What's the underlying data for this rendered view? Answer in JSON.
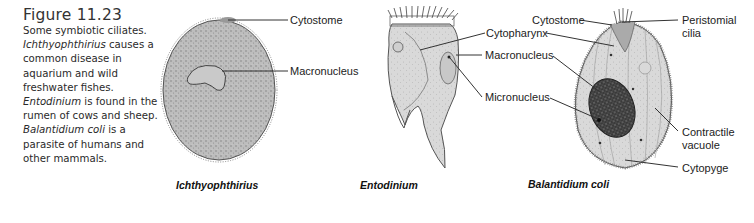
{
  "figure": {
    "number": "Figure 11.23",
    "caption_parts": [
      {
        "text": "Some symbiotic ciliates. ",
        "italic": false
      },
      {
        "text": "Ichthyophthirius",
        "italic": true
      },
      {
        "text": " causes a common disease in aquarium and wild freshwater fishes. ",
        "italic": false
      },
      {
        "text": "Entodinium",
        "italic": true
      },
      {
        "text": " is found in the rumen of cows and sheep. ",
        "italic": false
      },
      {
        "text": "Balantidium coli",
        "italic": true
      },
      {
        "text": " is a parasite of humans and other mammals.",
        "italic": false
      }
    ]
  },
  "organisms": [
    {
      "name": "Ichthyophthirius",
      "labels": [
        "Cytostome",
        "Macronucleus"
      ]
    },
    {
      "name": "Entodinium",
      "labels": [
        "Cytopharynx",
        "Macronucleus",
        "Micronucleus"
      ]
    },
    {
      "name": "Balantidium coli",
      "labels": [
        "Cytostome",
        "Peristomial cilia",
        "Contractile vacuole",
        "Cytopyge"
      ]
    }
  ],
  "labels": {
    "ich_cytostome": "Cytostome",
    "ich_macronucleus": "Macronucleus",
    "ent_cytopharynx": "Cytopharynx",
    "ent_macronucleus": "Macronucleus",
    "ent_micronucleus": "Micronucleus",
    "bal_cytostome": "Cytostome",
    "bal_peristomial_1": "Peristomial",
    "bal_peristomial_2": "cilia",
    "bal_contractile_1": "Contractile",
    "bal_contractile_2": "vacuole",
    "bal_cytopyge": "Cytopyge"
  },
  "species_names": {
    "ich": "Ichthyophthirius",
    "ent": "Entodinium",
    "bal": "Balantidium coli"
  }
}
